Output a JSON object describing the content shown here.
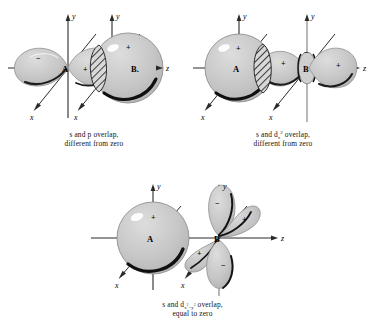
{
  "figure": {
    "background_color": "#ffffff",
    "ink_color": "#1a1a1a",
    "orbital_fill": "#c9c9c9",
    "orbital_stroke": "#8a8a8a",
    "hatch_color": "#2b2b2b"
  },
  "panels": [
    {
      "id": "s-p-overlap",
      "caption_line1": "s and p overlap,",
      "caption_line2": "different from zero",
      "atoms": [
        {
          "label": "A",
          "type": "p-orbital"
        },
        {
          "label": "B.",
          "type": "s-orbital"
        }
      ],
      "axes": [
        {
          "name": "y",
          "direction": "up"
        },
        {
          "name": "z",
          "direction": "right"
        },
        {
          "name": "x",
          "direction": "down-left"
        },
        {
          "name": "y",
          "direction": "up"
        },
        {
          "name": "x",
          "direction": "down-left"
        }
      ],
      "signs": [
        {
          "symbol": "−",
          "location": "left-p-lobe"
        },
        {
          "symbol": "+",
          "location": "right-p-lobe"
        },
        {
          "symbol": "+",
          "location": "s-sphere-B"
        }
      ],
      "overlap_region": "hatched"
    },
    {
      "id": "s-dz2-overlap",
      "caption_line1_pre": "s and d",
      "caption_line1_sub": "z",
      "caption_line1_sup": "2",
      "caption_line1_post": " overlap,",
      "caption_line2": "different from zero",
      "atoms": [
        {
          "label": "A",
          "type": "s-orbital"
        },
        {
          "label": "B",
          "type": "d-z2-orbital"
        }
      ],
      "axes": [
        {
          "name": "y",
          "direction": "up"
        },
        {
          "name": "z",
          "direction": "right"
        },
        {
          "name": "x",
          "direction": "down-left"
        },
        {
          "name": "y",
          "direction": "up"
        },
        {
          "name": "x",
          "direction": "down-left"
        }
      ],
      "signs": [
        {
          "symbol": "+",
          "location": "s-sphere-A"
        },
        {
          "symbol": "+",
          "location": "left-d-lobe"
        },
        {
          "symbol": "−",
          "location": "torus-B"
        },
        {
          "symbol": "+",
          "location": "right-d-lobe"
        }
      ],
      "overlap_region": "hatched"
    },
    {
      "id": "s-dx2y2-overlap",
      "caption_line1_pre": "s and d",
      "caption_line1_sub": "x",
      "caption_line1_sup": "2",
      "caption_line1_sub2": "−y",
      "caption_line1_sup2": "2",
      "caption_line1_post": " overlap,",
      "caption_line2": "equal to zero",
      "atoms": [
        {
          "label": "A",
          "type": "s-orbital"
        },
        {
          "label": "B",
          "type": "d-x2-y2-orbital"
        }
      ],
      "axes": [
        {
          "name": "y",
          "direction": "up"
        },
        {
          "name": "z",
          "direction": "right"
        },
        {
          "name": "x",
          "direction": "down-left"
        },
        {
          "name": "y",
          "direction": "up"
        },
        {
          "name": "x",
          "direction": "down-left"
        }
      ],
      "signs": [
        {
          "symbol": "+",
          "location": "s-sphere-A"
        },
        {
          "symbol": "−",
          "location": "upper-left-lobe"
        },
        {
          "symbol": "+",
          "location": "upper-right-lobe"
        },
        {
          "symbol": "+",
          "location": "lower-left-lobe"
        },
        {
          "symbol": "−",
          "location": "lower-right-lobe"
        }
      ],
      "overlap_region": "none"
    }
  ]
}
